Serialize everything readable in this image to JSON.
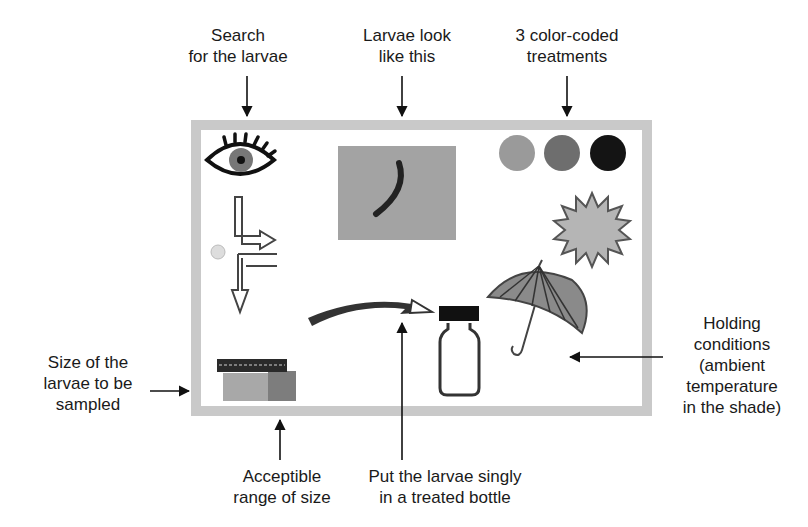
{
  "labels": {
    "search": [
      "Search",
      "for the larvae"
    ],
    "look": [
      "Larvae look",
      "like this"
    ],
    "treatments": [
      "3 color-coded",
      "treatments"
    ],
    "size": [
      "Size of the",
      "larvae to be",
      "sampled"
    ],
    "holding": [
      "Holding",
      "conditions",
      "(ambient",
      "temperature",
      "in the shade)"
    ],
    "range": [
      "Acceptible",
      "range of size"
    ],
    "bottle": [
      "Put the larvae singly",
      "in a treated bottle"
    ]
  },
  "colors": {
    "frame": "#c9c9c9",
    "treatment_1": "#9a9a9a",
    "treatment_2": "#6e6e6e",
    "treatment_3": "#141414",
    "photo_bg": "#a3a3a3",
    "sun": "#b5b5b5"
  }
}
